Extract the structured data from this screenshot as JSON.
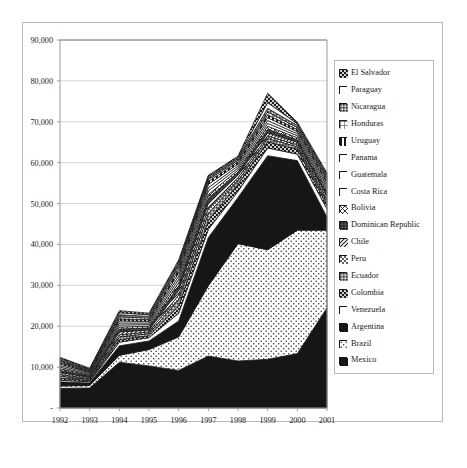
{
  "chart_data": {
    "type": "area",
    "title": "",
    "xlabel": "",
    "ylabel": "",
    "stacked": true,
    "grid": true,
    "legend_position": "right",
    "ylim": [
      0,
      90000
    ],
    "ytick_labels": [
      "90,000",
      "80,000",
      "70,000",
      "60,000",
      "50,000",
      "40,000",
      "30,000",
      "20,000",
      "10,000",
      "-"
    ],
    "yticks": [
      90000,
      80000,
      70000,
      60000,
      50000,
      40000,
      30000,
      20000,
      10000,
      0
    ],
    "categories": [
      "1992",
      "1993",
      "1994",
      "1995",
      "1996",
      "1997",
      "1998",
      "1999",
      "2000",
      "2001"
    ],
    "x": [
      1992,
      1993,
      1994,
      1995,
      1996,
      1997,
      1998,
      1999,
      2000,
      2001
    ],
    "series": [
      {
        "name": "Mexico",
        "pattern": "solid-black",
        "values": [
          4800,
          4900,
          11200,
          10300,
          9200,
          12700,
          11500,
          11900,
          13300,
          24500
        ]
      },
      {
        "name": "Brazil",
        "pattern": "dotted-white",
        "values": [
          5400,
          5500,
          12900,
          14300,
          17400,
          29900,
          40200,
          38700,
          43500,
          43500
        ]
      },
      {
        "name": "Argentina",
        "pattern": "solid-black",
        "values": [
          6400,
          6100,
          15200,
          16400,
          21300,
          41700,
          51500,
          61700,
          60500,
          46700
        ]
      },
      {
        "name": "Venezuela",
        "pattern": "white",
        "values": [
          6800,
          6400,
          16100,
          17200,
          23200,
          43700,
          53000,
          63600,
          62100,
          48700
        ]
      },
      {
        "name": "Colombia",
        "pattern": "dark-check",
        "values": [
          7300,
          6700,
          16700,
          17700,
          25000,
          45900,
          54700,
          65100,
          63300,
          49700
        ]
      },
      {
        "name": "Ecuador",
        "pattern": "gray-dense",
        "values": [
          7800,
          7000,
          17400,
          18200,
          26500,
          47600,
          55600,
          65900,
          63900,
          50400
        ]
      },
      {
        "name": "Peru",
        "pattern": "gray-check",
        "values": [
          8200,
          7200,
          17900,
          18600,
          27600,
          48800,
          56300,
          66500,
          64400,
          51000
        ]
      },
      {
        "name": "Chile",
        "pattern": "hatch-diag",
        "values": [
          8700,
          7500,
          18600,
          19100,
          28800,
          50100,
          57000,
          67300,
          65000,
          51800
        ]
      },
      {
        "name": "Dominican Republic",
        "pattern": "gray-dark",
        "values": [
          9200,
          7800,
          19300,
          19600,
          29900,
          51300,
          57700,
          68200,
          65600,
          52600
        ]
      },
      {
        "name": "Bolivia",
        "pattern": "hatch-cross",
        "values": [
          9600,
          8000,
          19800,
          20000,
          30700,
          52200,
          58200,
          68900,
          66100,
          53200
        ]
      },
      {
        "name": "Costa Rica",
        "pattern": "white",
        "values": [
          10000,
          8200,
          20300,
          20400,
          31500,
          53100,
          58700,
          69600,
          66600,
          53800
        ]
      },
      {
        "name": "Guatemala",
        "pattern": "white",
        "values": [
          10400,
          8500,
          20800,
          20800,
          32300,
          53900,
          59200,
          70300,
          67100,
          54400
        ]
      },
      {
        "name": "Panama",
        "pattern": "white",
        "values": [
          10800,
          8700,
          21300,
          21200,
          33100,
          54700,
          59700,
          71000,
          67600,
          55000
        ]
      },
      {
        "name": "Uruguay",
        "pattern": "half-black",
        "values": [
          11200,
          8900,
          21800,
          21600,
          33900,
          55400,
          60200,
          71700,
          68100,
          55600
        ]
      },
      {
        "name": "Honduras",
        "pattern": "grid-box",
        "values": [
          11500,
          9100,
          22300,
          22000,
          34600,
          55900,
          60600,
          72400,
          68600,
          56100
        ]
      },
      {
        "name": "Nicaragua",
        "pattern": "gray-dense",
        "values": [
          11800,
          9300,
          22800,
          22400,
          35200,
          56300,
          61000,
          73300,
          69100,
          56600
        ]
      },
      {
        "name": "Paraguay",
        "pattern": "white",
        "values": [
          12100,
          9500,
          23300,
          22800,
          35700,
          56600,
          61300,
          74700,
          69500,
          57000
        ]
      },
      {
        "name": "El Salvador",
        "pattern": "dark-check",
        "values": [
          12400,
          9700,
          23800,
          23200,
          36200,
          56900,
          61600,
          77000,
          69900,
          57500
        ]
      }
    ]
  },
  "legend": {
    "items": [
      {
        "label": "El Salvador",
        "swatch": "dark-check"
      },
      {
        "label": "Paraguay",
        "swatch": "white"
      },
      {
        "label": "Nicaragua",
        "swatch": "gray-dense"
      },
      {
        "label": "Honduras",
        "swatch": "grid-box"
      },
      {
        "label": "Uruguay",
        "swatch": "half-black"
      },
      {
        "label": "Panama",
        "swatch": "white"
      },
      {
        "label": "Guatemala",
        "swatch": "white"
      },
      {
        "label": "Costa Rica",
        "swatch": "white"
      },
      {
        "label": "Bolivia",
        "swatch": "hatch-cross"
      },
      {
        "label": "Dominican Republic",
        "swatch": "gray-dark"
      },
      {
        "label": "Chile",
        "swatch": "hatch-diag"
      },
      {
        "label": "Peru",
        "swatch": "gray-check"
      },
      {
        "label": "Ecuador",
        "swatch": "gray-dense"
      },
      {
        "label": "Colombia",
        "swatch": "dark-check"
      },
      {
        "label": "Venezuela",
        "swatch": "white"
      },
      {
        "label": "Argentina",
        "swatch": "solid-black"
      },
      {
        "label": "Brazil",
        "swatch": "dotted-white"
      },
      {
        "label": "Mexico",
        "swatch": "solid-black"
      }
    ]
  },
  "colors": {
    "axis": "#9a9a9a",
    "grid": "#d4d4d4",
    "frame": "#b9b9b9",
    "ink": "#1a1a1a",
    "paper": "#ffffff"
  }
}
